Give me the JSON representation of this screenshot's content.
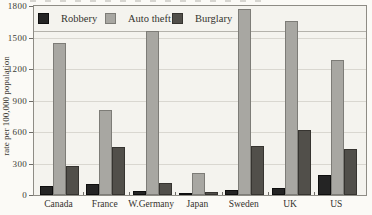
{
  "chart_data": {
    "type": "bar",
    "title": "",
    "xlabel": "",
    "ylabel": "rate per 100,000 population",
    "categories": [
      "Canada",
      "France",
      "W.Germany",
      "Japan",
      "Sweden",
      "UK",
      "US"
    ],
    "series": [
      {
        "name": "Robbery",
        "color": "#242424",
        "border_color": "#0e0e0e",
        "values": [
          90,
          105,
          40,
          10,
          50,
          65,
          195
        ]
      },
      {
        "name": "Auto theft",
        "color": "#a8a7a2",
        "border_color": "#7d7c77",
        "values": [
          1450,
          810,
          1560,
          210,
          1770,
          1660,
          1290
        ]
      },
      {
        "name": "Burglary",
        "color": "#514f4a",
        "border_color": "#363430",
        "values": [
          280,
          460,
          115,
          25,
          470,
          620,
          440
        ]
      }
    ],
    "ylim": [
      0,
      1800
    ],
    "yticks": [
      0,
      300,
      600,
      900,
      1200,
      1500,
      1800
    ],
    "grid": true,
    "legend_position": "top-left",
    "colors": {
      "page_bg": "#fbfaf6",
      "plot_bg": "#f4f3ee",
      "grid": "#d9d7d0",
      "plot_border": "#8e8c85",
      "text": "#3b3a35"
    }
  }
}
